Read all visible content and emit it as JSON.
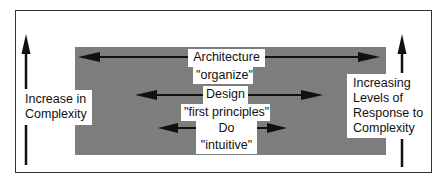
{
  "diagram": {
    "left_axis": {
      "label_line1": "Increase in",
      "label_line2": "Complexity",
      "arrow_direction": "up"
    },
    "right_axis": {
      "label_line1": "Increasing",
      "label_line2": "Levels of",
      "label_line3": "Response to",
      "label_line4": "Complexity",
      "arrow_direction": "up"
    },
    "levels": [
      {
        "name": "Architecture",
        "descriptor": "\"organize\"",
        "arrow": "widest"
      },
      {
        "name": "Design",
        "descriptor": "\"first principles\"",
        "arrow": "medium"
      },
      {
        "name": "Do",
        "descriptor": "\"intuitive\"",
        "arrow": "narrowest"
      }
    ],
    "colors": {
      "frame": "#333333",
      "shading": "#a9a9a9",
      "arrow": "#111111",
      "label_background": "#ffffff"
    }
  }
}
